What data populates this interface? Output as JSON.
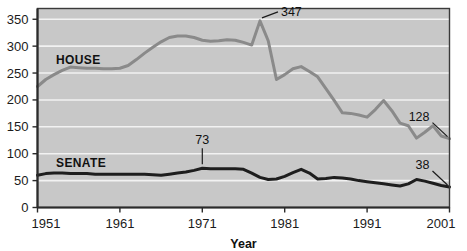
{
  "figure": {
    "clipped_title": "",
    "plot_bg": "#c8c8c8",
    "page_bg": "#ffffff",
    "grid_color": "#f2f2f2",
    "axis_color": "#3a3a3a"
  },
  "chart_data": {
    "type": "line",
    "title": "",
    "xlabel": "Year",
    "ylabel": "",
    "xlim": [
      1951,
      2001
    ],
    "ylim": [
      0,
      370
    ],
    "yticks": [
      0,
      50,
      100,
      150,
      200,
      250,
      300,
      350
    ],
    "xticks": [
      1951,
      1961,
      1971,
      1981,
      1991,
      2001
    ],
    "xtick_labels": [
      "1951",
      "1961",
      "1971",
      "1981",
      "1991",
      "2001"
    ],
    "ytick_labels": [
      "0",
      "50",
      "100",
      "150",
      "200",
      "250",
      "300",
      "350"
    ],
    "grid": true,
    "grid_axis": "y",
    "legend": "inline-labels",
    "x": [
      1951,
      1952,
      1953,
      1954,
      1955,
      1956,
      1957,
      1958,
      1959,
      1960,
      1961,
      1962,
      1963,
      1964,
      1965,
      1966,
      1967,
      1968,
      1969,
      1970,
      1971,
      1972,
      1973,
      1974,
      1975,
      1976,
      1977,
      1978,
      1979,
      1980,
      1981,
      1982,
      1983,
      1984,
      1985,
      1986,
      1987,
      1988,
      1989,
      1990,
      1991,
      1992,
      1993,
      1994,
      1995,
      1996,
      1997,
      1998,
      1999,
      2000,
      2001
    ],
    "series": [
      {
        "name": "HOUSE",
        "color": "#8a8a8a",
        "values": [
          225,
          238,
          247,
          255,
          261,
          260,
          259,
          259,
          258,
          258,
          259,
          264,
          275,
          287,
          298,
          308,
          316,
          319,
          319,
          316,
          311,
          309,
          310,
          312,
          311,
          307,
          302,
          347,
          310,
          238,
          247,
          258,
          262,
          253,
          243,
          221,
          199,
          176,
          175,
          172,
          168,
          182,
          199,
          180,
          157,
          152,
          129,
          140,
          152,
          133,
          128
        ]
      },
      {
        "name": "SENATE",
        "color": "#1e1e1e",
        "values": [
          60,
          63,
          64,
          64,
          63,
          63,
          63,
          62,
          62,
          62,
          62,
          62,
          62,
          62,
          61,
          60,
          62,
          64,
          66,
          69,
          73,
          72,
          72,
          72,
          72,
          71,
          64,
          56,
          52,
          53,
          58,
          65,
          71,
          64,
          53,
          54,
          56,
          55,
          53,
          50,
          48,
          46,
          44,
          42,
          40,
          44,
          52,
          49,
          45,
          41,
          38
        ]
      }
    ],
    "annotations": [
      {
        "label": "347",
        "series": "HOUSE",
        "year": 1978,
        "value": 347,
        "leader": "horizontal-right"
      },
      {
        "label": "128",
        "series": "HOUSE",
        "year": 2001,
        "value": 128,
        "leader": "diagonal-down-right"
      },
      {
        "label": "73",
        "series": "SENATE",
        "year": 1971,
        "value": 73,
        "leader": "vertical-down"
      },
      {
        "label": "38",
        "series": "SENATE",
        "year": 2001,
        "value": 38,
        "leader": "diagonal-down-right"
      }
    ]
  }
}
